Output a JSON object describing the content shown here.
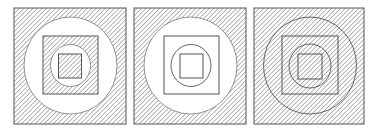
{
  "figure": {
    "colors": {
      "background": "#ffffff",
      "stroke": "#555555",
      "hatch": "#8a8a8a"
    },
    "panels": [
      {
        "id": "panel-1",
        "outer_square": "hatched",
        "large_circle": "white",
        "middle_square": "hatched",
        "small_circle": "white",
        "inner_square": "hatched"
      },
      {
        "id": "panel-2",
        "outer_square": "hatched",
        "large_circle": "white",
        "middle_square": "white",
        "small_circle": "white",
        "inner_square": "white"
      },
      {
        "id": "panel-3",
        "outer_square": "hatched",
        "large_circle": "hatched",
        "middle_square": "hatched",
        "small_circle": "hatched",
        "inner_square": "hatched"
      }
    ]
  }
}
